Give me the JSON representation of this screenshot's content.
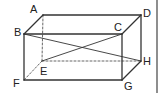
{
  "diagram": {
    "type": "rectangular-prism",
    "stroke_color": "#333333",
    "hidden_stroke_color": "#555555",
    "background": "#ffffff",
    "vertices": {
      "A": {
        "label": "A",
        "x": 43,
        "y": 15,
        "lx": 30,
        "ly": 13
      },
      "B": {
        "label": "B",
        "x": 24,
        "y": 34,
        "lx": 14,
        "ly": 36
      },
      "C": {
        "label": "C",
        "x": 122,
        "y": 34,
        "lx": 114,
        "ly": 31
      },
      "D": {
        "label": "D",
        "x": 141,
        "y": 15,
        "lx": 143,
        "ly": 17
      },
      "E": {
        "label": "E",
        "x": 42,
        "y": 61,
        "lx": 40,
        "ly": 75
      },
      "F": {
        "label": "F",
        "x": 24,
        "y": 80,
        "lx": 13,
        "ly": 87
      },
      "G": {
        "label": "G",
        "x": 122,
        "y": 80,
        "lx": 124,
        "ly": 90
      },
      "H": {
        "label": "H",
        "x": 141,
        "y": 61,
        "lx": 143,
        "ly": 65
      }
    },
    "solid_edges": [
      "AD",
      "AB",
      "BC",
      "CD",
      "BF",
      "FG",
      "CG",
      "GH",
      "DH"
    ],
    "hidden_edges": [
      "AE",
      "EF",
      "EH"
    ],
    "diagonals": [
      "BH",
      "CE"
    ]
  }
}
